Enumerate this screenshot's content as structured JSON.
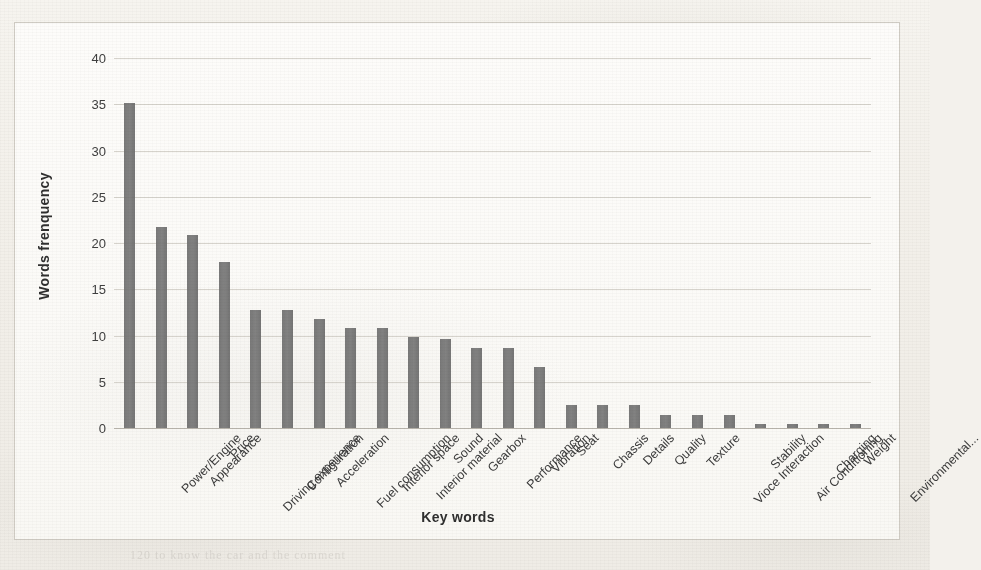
{
  "chart_data": {
    "type": "bar",
    "title": "",
    "xlabel": "Key words",
    "ylabel": "Words frenquency",
    "ylim": [
      0,
      40
    ],
    "yticks": [
      0,
      5,
      10,
      15,
      20,
      25,
      30,
      35,
      40
    ],
    "grid": true,
    "legend": "none",
    "bar_color": "#6e6e6e",
    "categories": [
      "Power/Engine",
      "Appearance",
      "Price",
      "Driving experience",
      "Configuration",
      "Acceleration",
      "Fuel consumption",
      "Interior space",
      "Interior material",
      "Sound",
      "Gearbox",
      "Performance",
      "Vibration",
      "Seat",
      "Chassis",
      "Details",
      "Quality",
      "Texture",
      "Vioce Interaction",
      "Stability",
      "Air Conditioning",
      "Charging",
      "Weight",
      "Environmental..."
    ],
    "values": [
      35.1,
      21.7,
      20.9,
      17.9,
      12.8,
      12.8,
      11.8,
      10.8,
      10.8,
      9.8,
      9.6,
      8.7,
      8.7,
      6.6,
      2.5,
      2.5,
      2.5,
      1.4,
      1.4,
      1.4,
      0.4,
      0.4,
      0.4,
      0.4
    ]
  },
  "background": {
    "bleed_text": [
      "and",
      "in the of  Fig 2",
      "the data set",
      "of the  most",
      "frequency words in",
      "user reviews were",
      "collected and",
      "ranked by count",
      "the figure shows",
      "120   to know  the  car  and  the  comment"
    ]
  }
}
